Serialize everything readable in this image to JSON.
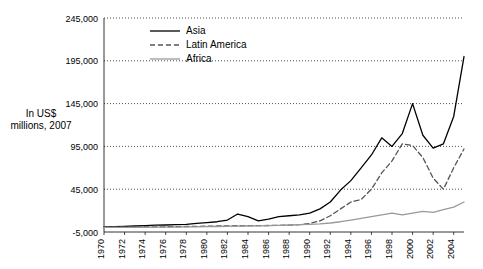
{
  "axis_title": "In US$ millions, 2007",
  "chart_data": {
    "type": "line",
    "title": "",
    "subtitle": "",
    "xlabel": "",
    "ylabel": "In US$ millions, 2007",
    "ylim": [
      -5000,
      245000
    ],
    "yticks": [
      -5000,
      45000,
      95000,
      145000,
      195000,
      245000
    ],
    "ytick_labels": [
      "-5,000",
      "45,000",
      "95,000",
      "145,000",
      "195,000",
      "245,000"
    ],
    "grid": true,
    "legend_position": "top-left",
    "x": [
      1970,
      1971,
      1972,
      1973,
      1974,
      1975,
      1976,
      1977,
      1978,
      1979,
      1980,
      1981,
      1982,
      1983,
      1984,
      1985,
      1986,
      1987,
      1988,
      1989,
      1990,
      1991,
      1992,
      1993,
      1994,
      1995,
      1996,
      1997,
      1998,
      1999,
      2000,
      2001,
      2002,
      2003,
      2004,
      2005
    ],
    "xtick_labels": [
      "1970",
      "1972",
      "1974",
      "1976",
      "1978",
      "1980",
      "1982",
      "1984",
      "1986",
      "1988",
      "1990",
      "1992",
      "1994",
      "1996",
      "1998",
      "2000",
      "2002",
      "2004"
    ],
    "series": [
      {
        "name": "Asia",
        "color": "#000000",
        "style": "solid",
        "values": [
          1000,
          1200,
          1500,
          2000,
          2500,
          3000,
          3200,
          3500,
          4000,
          5000,
          6000,
          7000,
          9000,
          16000,
          13000,
          8000,
          10000,
          13000,
          14000,
          15000,
          17000,
          22000,
          30000,
          44000,
          55000,
          70000,
          85000,
          105000,
          95000,
          110000,
          145000,
          108000,
          93000,
          98000,
          130000,
          200000
        ]
      },
      {
        "name": "Latin America",
        "color": "#555555",
        "style": "dashed",
        "values": [
          500,
          600,
          700,
          800,
          900,
          1000,
          1100,
          1200,
          1400,
          1600,
          1800,
          2000,
          2200,
          2300,
          2400,
          2500,
          2600,
          2800,
          3000,
          3500,
          5000,
          8000,
          14000,
          22000,
          30000,
          33000,
          45000,
          64000,
          78000,
          98000,
          96000,
          82000,
          58000,
          45000,
          70000,
          92000
        ]
      },
      {
        "name": "Africa",
        "color": "#999999",
        "style": "solid",
        "values": [
          300,
          350,
          400,
          450,
          500,
          600,
          700,
          800,
          900,
          1000,
          1200,
          1400,
          1600,
          1800,
          2000,
          2200,
          2500,
          2800,
          3200,
          3600,
          4000,
          4500,
          5500,
          7000,
          9000,
          11000,
          13000,
          15000,
          17000,
          15000,
          17000,
          19000,
          18000,
          21000,
          24000,
          30000
        ]
      }
    ]
  },
  "legend": {
    "items": [
      {
        "label": "Asia",
        "style": "solid",
        "color": "#000000"
      },
      {
        "label": "Latin America",
        "style": "dashed",
        "color": "#555555"
      },
      {
        "label": "Africa",
        "style": "solid",
        "color": "#999999"
      }
    ]
  }
}
